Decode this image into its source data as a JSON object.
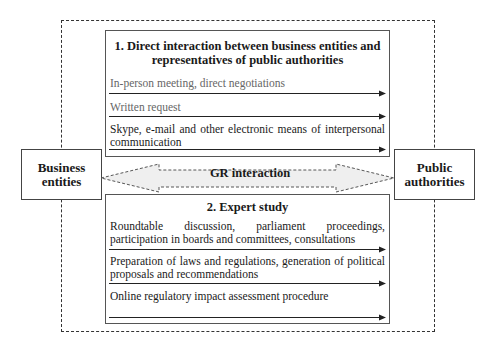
{
  "left_actor": {
    "line1": "Business",
    "line2": "entities"
  },
  "right_actor": {
    "line1": "Public",
    "line2": "authorities"
  },
  "center_arrow": {
    "label": "GR interaction",
    "fill": "#efefef"
  },
  "section1": {
    "title_line1": "1. Direct interaction between business entities and",
    "title_line2": "representatives of public authorities",
    "items": [
      {
        "text": "In-person meeting, direct negotiations"
      },
      {
        "text": "Written request"
      },
      {
        "text": "Skype, e-mail and other electronic means of interpersonal communication"
      }
    ]
  },
  "section2": {
    "title": "2. Expert study",
    "items": [
      {
        "text": "Roundtable discussion, parliament proceedings, participation in boards and committees, consultations"
      },
      {
        "text": "Preparation of laws and regulations, generation of political proposals and recommendations"
      },
      {
        "text": "Online regulatory impact assessment procedure"
      }
    ]
  }
}
